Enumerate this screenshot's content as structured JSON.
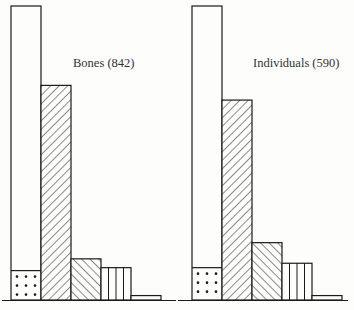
{
  "chart_data": [
    {
      "type": "bar",
      "title": "Bones (842)",
      "categories": [
        "A",
        "B",
        "C",
        "D",
        "E"
      ],
      "patterns": [
        "dots-base-with-open-top",
        "diagonal-right",
        "diagonal-left",
        "vertical",
        "plain"
      ],
      "values": [
        100,
        73,
        14,
        11,
        1.5
      ],
      "stacked_dotted_base": [
        10,
        0,
        0,
        0,
        0
      ],
      "xlabel": "",
      "ylabel": "",
      "ylim": [
        0,
        100
      ],
      "grid": false,
      "legend": "none"
    },
    {
      "type": "bar",
      "title": "Individuals (590)",
      "categories": [
        "A",
        "B",
        "C",
        "D",
        "E"
      ],
      "patterns": [
        "dots-base-with-open-top",
        "diagonal-right",
        "diagonal-left",
        "vertical",
        "plain"
      ],
      "values": [
        100,
        68,
        19.5,
        12.5,
        1.5
      ],
      "stacked_dotted_base": [
        11,
        0,
        0,
        0,
        0
      ],
      "xlabel": "",
      "ylabel": "",
      "ylim": [
        0,
        100
      ],
      "grid": false,
      "legend": "none"
    }
  ],
  "labels": {
    "left": "Bones (842)",
    "right": "Individuals (590)"
  },
  "colors": {
    "ink": "#1a1a1a",
    "paper": "#fdfdfb"
  }
}
